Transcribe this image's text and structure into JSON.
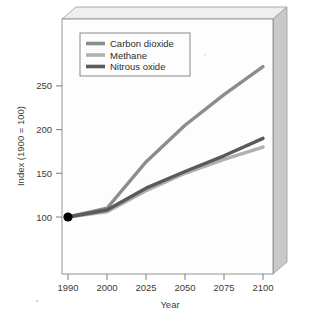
{
  "chart_data": {
    "type": "line",
    "title": "",
    "xlabel": "Year",
    "ylabel": "Index (1900 = 100)",
    "x": [
      1990,
      2000,
      2025,
      2050,
      2075,
      2100
    ],
    "xtick_labels": [
      "1990",
      "2000",
      "2025",
      "2050",
      "2075",
      "2100"
    ],
    "ytick_labels": [
      "100",
      "150",
      "200",
      "250"
    ],
    "yticks": [
      100,
      150,
      200,
      250
    ],
    "ylim": [
      60,
      290
    ],
    "xlim_note": "categorical-even-spacing",
    "grid": false,
    "legend_position": "top-left-inside",
    "origin_marker": {
      "x": 1990,
      "y": 100,
      "shape": "filled-circle",
      "color": "#000000"
    },
    "series": [
      {
        "name": "Carbon dioxide",
        "color": "#8c8c8c",
        "values": [
          100,
          110,
          163,
          205,
          240,
          272
        ]
      },
      {
        "name": "Methane",
        "color": "#b0b0b0",
        "values": [
          100,
          106,
          130,
          150,
          166,
          180
        ]
      },
      {
        "name": "Nitrous oxide",
        "color": "#5a5a5a",
        "values": [
          100,
          108,
          133,
          152,
          170,
          190
        ]
      }
    ]
  },
  "legend": {
    "entries": [
      {
        "label": "Carbon dioxide",
        "swatch_color": "#8c8c8c"
      },
      {
        "label": "Methane",
        "swatch_color": "#b0b0b0"
      },
      {
        "label": "Nitrous oxide",
        "swatch_color": "#5a5a5a"
      }
    ]
  },
  "axes": {
    "x_title": "Year",
    "y_title": "Index (1900 = 100)",
    "x_ticks": [
      "1990",
      "2000",
      "2025",
      "2050",
      "2075",
      "2100"
    ],
    "y_ticks": [
      "250",
      "200",
      "150",
      "100"
    ]
  },
  "frame": {
    "plot_background": "#fdfdfd",
    "bevel_light": "#e4e4e4",
    "bevel_mid": "#c9c9c9",
    "bevel_dark": "#a8a8a8",
    "border_color": "#8a8a8a"
  }
}
